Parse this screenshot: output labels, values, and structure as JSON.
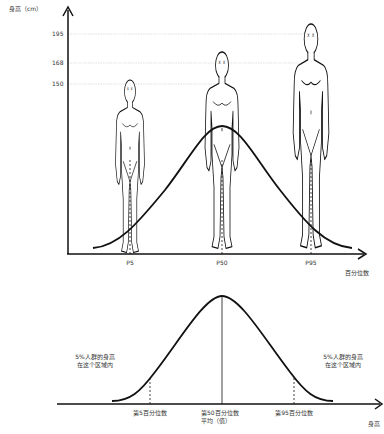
{
  "top_chart": {
    "y_axis_label": "身高（cm）",
    "y_ticks": [
      {
        "label": "195",
        "y": 34
      },
      {
        "label": "168",
        "y": 63
      },
      {
        "label": "150",
        "y": 84
      }
    ],
    "x_axis_label": "百分位数",
    "x_ticks": [
      {
        "label": "P5",
        "x": 130
      },
      {
        "label": "P50",
        "x": 222
      },
      {
        "label": "P95",
        "x": 311
      }
    ],
    "figures": [
      {
        "name": "P5",
        "height_cm": 150
      },
      {
        "name": "P50",
        "height_cm": 168
      },
      {
        "name": "P95",
        "height_cm": 195
      }
    ]
  },
  "bottom_chart": {
    "x_axis_label": "身高",
    "left_annotation_line1": "5%人群的身高",
    "left_annotation_line2": "在这个区域内",
    "right_annotation_line1": "5%人群的身高",
    "right_annotation_line2": "在这个区域内",
    "p5_label": "第5百分位数",
    "p50_label_line1": "第50百分位数",
    "p50_label_line2": "平均（值）",
    "p95_label": "第95百分位数"
  },
  "colors": {
    "line": "#111111",
    "grid": "#cccccc",
    "text": "#333333"
  }
}
